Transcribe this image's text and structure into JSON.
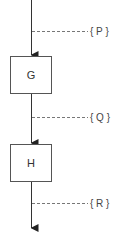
{
  "diagram": {
    "nodes": [
      {
        "id": "G",
        "label": "G"
      },
      {
        "id": "H",
        "label": "H"
      }
    ],
    "flows": [
      {
        "label": "{ P }",
        "from": null,
        "to": "G"
      },
      {
        "label": "{ Q }",
        "from": "G",
        "to": "H"
      },
      {
        "label": "{ R }",
        "from": "H",
        "to": null
      }
    ],
    "colors": {
      "line": "#333333",
      "box_border": "#555555",
      "dashed": "#777777"
    }
  }
}
